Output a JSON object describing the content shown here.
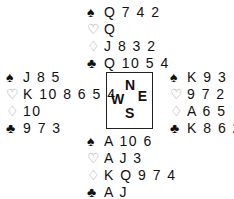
{
  "north": {
    "spades": "Q 7 4 2",
    "hearts": "Q",
    "diamonds": "J 8 3 2",
    "clubs": "Q 10 5 4"
  },
  "west": {
    "spades": "J 8 5",
    "hearts": "K 10 8 6 5 4",
    "diamonds": "10",
    "clubs": "9 7 3"
  },
  "east": {
    "spades": "K 9 3",
    "hearts": "9 7 2",
    "diamonds": "A 6 5",
    "clubs": "K 8 6 2"
  },
  "south": {
    "spades": "A 10 6",
    "hearts": "A J 3",
    "diamonds": "K Q 9 7 4",
    "clubs": "A J"
  },
  "compass": {
    "n": "N",
    "w": "W",
    "e": "E",
    "s": "S"
  },
  "symbols": {
    "spades": "♠",
    "hearts": "♡",
    "diamonds": "♢",
    "clubs": "♣"
  }
}
